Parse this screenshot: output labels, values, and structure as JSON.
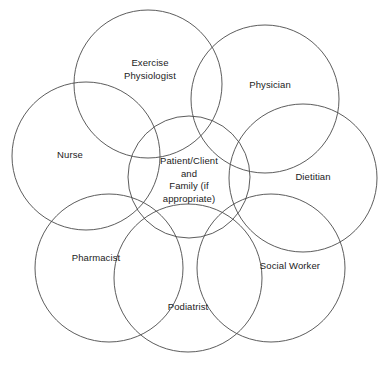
{
  "diagram": {
    "type": "venn-overlapping-circles",
    "stroke_color": "#4a4a4a",
    "text_color": "#1b1b1b",
    "background_color": "#ffffff",
    "center": {
      "id": "patient-client",
      "label": "Patient/Client\nand\nFamily (if\nappropriate)",
      "cx": 189,
      "cy": 177,
      "r": 61,
      "label_x": 189,
      "label_y": 180
    },
    "members": [
      {
        "id": "exercise-physiologist",
        "label": "Exercise\nPhysiologist",
        "cx": 148,
        "cy": 84,
        "r": 74,
        "label_x": 150,
        "label_y": 69
      },
      {
        "id": "physician",
        "label": "Physician",
        "cx": 265,
        "cy": 99,
        "r": 74,
        "label_x": 270,
        "label_y": 85
      },
      {
        "id": "dietitian",
        "label": "Dietitian",
        "cx": 303,
        "cy": 178,
        "r": 74,
        "label_x": 313,
        "label_y": 177
      },
      {
        "id": "social-worker",
        "label": "Social Worker",
        "cx": 271,
        "cy": 268,
        "r": 74,
        "label_x": 290,
        "label_y": 266
      },
      {
        "id": "podiatrist",
        "label": "Podiatrist",
        "cx": 188,
        "cy": 278,
        "r": 74,
        "label_x": 188,
        "label_y": 307
      },
      {
        "id": "pharmacist",
        "label": "Pharmacist",
        "cx": 109,
        "cy": 268,
        "r": 74,
        "label_x": 96,
        "label_y": 258
      },
      {
        "id": "nurse",
        "label": "Nurse",
        "cx": 86,
        "cy": 156,
        "r": 74,
        "label_x": 70,
        "label_y": 155
      }
    ]
  }
}
